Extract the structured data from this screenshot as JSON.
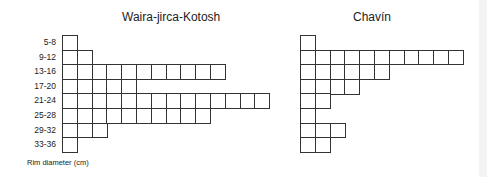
{
  "chart_data": [
    {
      "type": "bar",
      "orientation": "horizontal",
      "style": "stacked-unit-squares",
      "title": "Waira-jirca-Kotosh",
      "categories": [
        "5-8",
        "9-12",
        "13-16",
        "17-20",
        "21-24",
        "25-28",
        "29-32",
        "33-36"
      ],
      "values": [
        1,
        2,
        11,
        5,
        14,
        10,
        3,
        1
      ],
      "xlabel": "",
      "ylabel": "Rim diameter (cm)"
    },
    {
      "type": "bar",
      "orientation": "horizontal",
      "style": "stacked-unit-squares",
      "title": "Chavín",
      "categories": [
        "5-8",
        "9-12",
        "13-16",
        "17-20",
        "21-24",
        "25-28",
        "29-32",
        "33-36"
      ],
      "values": [
        1,
        11,
        6,
        4,
        2,
        1,
        3,
        2
      ],
      "xlabel": "",
      "ylabel": "Rim diameter (cm)"
    }
  ],
  "axis_title": "Rim diameter (cm)"
}
